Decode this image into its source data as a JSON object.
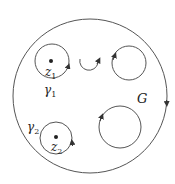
{
  "diagram": {
    "region_label": "G",
    "contours": [
      {
        "id": "gamma1",
        "label": "γ",
        "subscript": "1",
        "point_label": "z",
        "point_subscript": "1"
      },
      {
        "id": "gamma2",
        "label": "γ",
        "subscript": "2",
        "point_label": "z",
        "point_subscript": "2"
      }
    ],
    "colors": {
      "stroke": "#555555",
      "ink": "#222222",
      "background": "#ffffff"
    }
  }
}
